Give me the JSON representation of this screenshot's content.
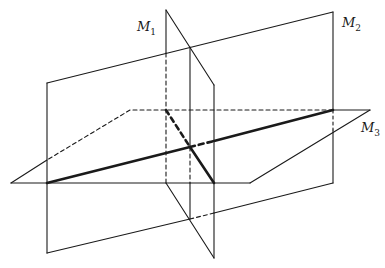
{
  "diagram": {
    "colors": {
      "stroke": "#1a1a1a",
      "background": "#ffffff"
    },
    "labels": {
      "m1": {
        "main": "M",
        "sub": "1"
      },
      "m2": {
        "main": "M",
        "sub": "2"
      },
      "m3": {
        "main": "M",
        "sub": "3"
      }
    },
    "planes": [
      {
        "id": "M1",
        "orientation": "vertical, perpendicular to M2"
      },
      {
        "id": "M2",
        "orientation": "vertical"
      },
      {
        "id": "M3",
        "orientation": "horizontal"
      }
    ],
    "intersection_lines": [
      {
        "planes": [
          "M2",
          "M3"
        ],
        "style": "thick"
      },
      {
        "planes": [
          "M1",
          "M3"
        ],
        "style": "thick"
      },
      {
        "planes": [
          "M1",
          "M2"
        ],
        "style": "thin"
      }
    ]
  }
}
